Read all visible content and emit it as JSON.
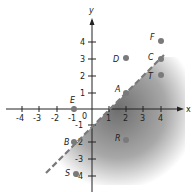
{
  "diagram": {
    "type": "coordinate-plane",
    "axes": {
      "x_label": "x",
      "y_label": "y",
      "x_ticks": [
        "-4",
        "-3",
        "-2",
        "-1",
        "1",
        "2",
        "3",
        "4"
      ],
      "y_ticks": [
        "4",
        "3",
        "2",
        "1",
        "-1",
        "-2",
        "-3",
        "-4"
      ],
      "origin_label": "0"
    },
    "boundary_line": {
      "equation": "y = x - 1",
      "style": "dashed"
    },
    "shaded_region": "below line",
    "points": [
      {
        "label": "A",
        "x": 2,
        "y": 1
      },
      {
        "label": "B",
        "x": -1,
        "y": -2
      },
      {
        "label": "C",
        "x": 4,
        "y": 3
      },
      {
        "label": "D",
        "x": 2,
        "y": 3
      },
      {
        "label": "E",
        "x": -1,
        "y": 0
      },
      {
        "label": "F",
        "x": 4,
        "y": 4
      },
      {
        "label": "R",
        "x": 2,
        "y": -2
      },
      {
        "label": "S",
        "x": -1,
        "y": -4
      },
      {
        "label": "T",
        "x": 4,
        "y": 2
      }
    ],
    "colors": {
      "shade": "#8a8a8a",
      "point": "#7a7a7a",
      "axis": "#222222"
    }
  }
}
